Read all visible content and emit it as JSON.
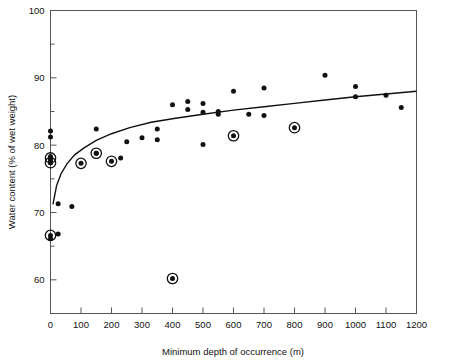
{
  "chart_data": {
    "type": "scatter",
    "title": "",
    "xlabel": "Minimum depth of occurrence (m)",
    "ylabel": "Water content (% of wet weight)",
    "xlim": [
      0,
      1200
    ],
    "ylim": [
      55,
      100
    ],
    "grid": false,
    "legend": "none",
    "xticks": [
      0,
      100,
      200,
      300,
      400,
      500,
      600,
      700,
      800,
      900,
      1000,
      1100,
      1200
    ],
    "xticklabels": [
      "0",
      "100",
      "200",
      "300",
      "400",
      "500",
      "600",
      "700",
      "800",
      "900",
      "1000",
      "1100",
      "1200"
    ],
    "yticks": [
      60,
      70,
      80,
      90,
      100
    ],
    "yticklabels": [
      "60",
      "70",
      "80",
      "90",
      "100"
    ],
    "y_minor_ticks": [
      65,
      75,
      85,
      95
    ],
    "series": [
      {
        "name": "plain-points",
        "marker": "filled-circle",
        "points": [
          [
            0,
            82.1
          ],
          [
            0,
            81.2
          ],
          [
            0,
            78.3
          ],
          [
            0,
            77.8
          ],
          [
            0,
            77.4
          ],
          [
            0,
            66.1
          ],
          [
            25,
            71.3
          ],
          [
            25,
            66.8
          ],
          [
            70,
            70.9
          ],
          [
            150,
            82.4
          ],
          [
            150,
            78.8
          ],
          [
            230,
            78.1
          ],
          [
            250,
            80.5
          ],
          [
            300,
            81.1
          ],
          [
            350,
            82.4
          ],
          [
            350,
            80.8
          ],
          [
            400,
            86.0
          ],
          [
            450,
            86.5
          ],
          [
            450,
            85.3
          ],
          [
            500,
            86.2
          ],
          [
            500,
            84.9
          ],
          [
            500,
            80.1
          ],
          [
            550,
            85.0
          ],
          [
            550,
            84.6
          ],
          [
            600,
            88.0
          ],
          [
            650,
            84.6
          ],
          [
            700,
            88.5
          ],
          [
            700,
            84.4
          ],
          [
            900,
            90.4
          ],
          [
            1000,
            88.7
          ],
          [
            1000,
            87.2
          ],
          [
            1100,
            87.4
          ],
          [
            1150,
            85.6
          ]
        ]
      },
      {
        "name": "circled-points",
        "marker": "filled-circle-with-ring",
        "points": [
          [
            0,
            78.1
          ],
          [
            0,
            77.4
          ],
          [
            0,
            66.6
          ],
          [
            100,
            77.3
          ],
          [
            150,
            78.8
          ],
          [
            200,
            77.6
          ],
          [
            400,
            60.2
          ],
          [
            600,
            81.4
          ],
          [
            800,
            82.6
          ]
        ]
      }
    ],
    "fit_curve": {
      "name": "logarithmic-fit-line",
      "points": [
        [
          8,
          71.2
        ],
        [
          20,
          74.0
        ],
        [
          35,
          75.8
        ],
        [
          55,
          77.3
        ],
        [
          80,
          78.6
        ],
        [
          110,
          79.6
        ],
        [
          150,
          80.7
        ],
        [
          200,
          81.7
        ],
        [
          260,
          82.6
        ],
        [
          330,
          83.4
        ],
        [
          410,
          84.0
        ],
        [
          500,
          84.6
        ],
        [
          600,
          85.2
        ],
        [
          700,
          85.7
        ],
        [
          800,
          86.2
        ],
        [
          900,
          86.7
        ],
        [
          1000,
          87.2
        ],
        [
          1100,
          87.6
        ],
        [
          1200,
          88.0
        ]
      ]
    }
  }
}
